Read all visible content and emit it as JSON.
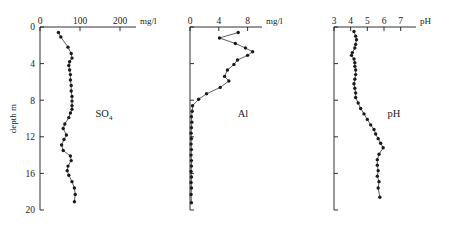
{
  "figure": {
    "depth_axis": {
      "title": "depth m",
      "ticks": [
        "0",
        "4",
        "8",
        "12",
        "16",
        "20"
      ],
      "tick_values": [
        0,
        4,
        8,
        12,
        16,
        20
      ],
      "range": [
        0,
        20
      ]
    },
    "panels": [
      {
        "name": "so4",
        "label": "SO",
        "label_sub": "4",
        "unit": "mg/l",
        "ticks": [
          "0",
          "100",
          "200"
        ],
        "tick_values": [
          0,
          100,
          200
        ],
        "range": [
          0,
          240
        ]
      },
      {
        "name": "al",
        "label": "Al",
        "label_sub": "",
        "unit": "mg/l",
        "ticks": [
          "0",
          "4",
          "8"
        ],
        "tick_values": [
          0,
          4,
          8
        ],
        "range": [
          0,
          10
        ]
      },
      {
        "name": "ph",
        "label": "pH",
        "label_sub": "",
        "unit": "pH",
        "ticks": [
          "3",
          "4",
          "5",
          "6",
          "7"
        ],
        "tick_values": [
          3,
          4,
          5,
          6,
          7
        ],
        "range": [
          3,
          7.8
        ]
      }
    ]
  },
  "chart_data": [
    {
      "type": "line",
      "title": "SO4",
      "xlabel": "mg/l",
      "ylabel": "depth m",
      "xlim": [
        0,
        240
      ],
      "ylim": [
        0,
        20
      ],
      "y_inverted": true,
      "grid": false,
      "legend": "none",
      "xticks": [
        0,
        100,
        200
      ],
      "yticks": [
        0,
        4,
        8,
        12,
        16,
        20
      ],
      "x": [
        46,
        52,
        70,
        78,
        80,
        74,
        72,
        74,
        76,
        76,
        78,
        78,
        80,
        80,
        80,
        80,
        76,
        72,
        62,
        58,
        66,
        60,
        54,
        58,
        76,
        78,
        70,
        68,
        72,
        80,
        86,
        88,
        86
      ],
      "y": [
        0.6,
        1.1,
        2.2,
        2.9,
        3.4,
        3.8,
        4.2,
        4.7,
        5.2,
        5.8,
        6.4,
        7.0,
        7.6,
        8.1,
        8.6,
        9.0,
        9.4,
        9.9,
        10.6,
        11.1,
        11.8,
        12.3,
        12.9,
        13.5,
        14.1,
        14.6,
        15.2,
        15.7,
        16.2,
        16.9,
        17.6,
        18.3,
        19.1
      ]
    },
    {
      "type": "line",
      "title": "Al",
      "xlabel": "mg/l",
      "ylabel": "depth m",
      "xlim": [
        0,
        10
      ],
      "ylim": [
        0,
        20
      ],
      "y_inverted": true,
      "grid": false,
      "legend": "none",
      "xticks": [
        0,
        4,
        8
      ],
      "yticks": [
        0,
        4,
        8,
        12,
        16,
        20
      ],
      "x": [
        6.7,
        4.1,
        6.3,
        7.7,
        8.7,
        8.0,
        6.6,
        6.1,
        5.2,
        4.8,
        5.4,
        4.2,
        2.3,
        1.2,
        0.35,
        0.3,
        0.2,
        0.25,
        0.2,
        0.15,
        0.2,
        0.15,
        0.2,
        0.15,
        0.2,
        0.2,
        0.15,
        0.2,
        0.15,
        0.2,
        0.15,
        0.2
      ],
      "y": [
        0.6,
        1.2,
        1.8,
        2.3,
        2.7,
        3.1,
        3.6,
        4.1,
        4.7,
        5.4,
        5.9,
        6.6,
        7.3,
        7.9,
        8.6,
        9.2,
        9.8,
        10.4,
        11.0,
        11.6,
        12.2,
        12.8,
        13.4,
        14.0,
        14.6,
        15.2,
        15.8,
        16.4,
        17.0,
        17.6,
        18.3,
        19.2
      ]
    },
    {
      "type": "line",
      "title": "pH",
      "xlabel": "pH",
      "ylabel": "depth m",
      "xlim": [
        3,
        7.8
      ],
      "ylim": [
        0,
        20
      ],
      "y_inverted": true,
      "grid": false,
      "legend": "none",
      "xticks": [
        3,
        4,
        5,
        6,
        7
      ],
      "yticks": [
        0,
        4,
        8,
        12,
        16,
        20
      ],
      "x": [
        4.2,
        4.3,
        4.35,
        4.3,
        4.25,
        4.1,
        4.05,
        4.2,
        4.25,
        4.25,
        4.3,
        4.3,
        4.25,
        4.2,
        4.25,
        4.3,
        4.3,
        4.45,
        4.6,
        4.8,
        5.0,
        5.2,
        5.4,
        5.5,
        5.65,
        5.8,
        5.95,
        5.7,
        5.6,
        5.6,
        5.65,
        5.6,
        5.7,
        5.65,
        5.75
      ],
      "y": [
        0.5,
        1.0,
        1.4,
        1.9,
        2.3,
        2.8,
        3.1,
        3.5,
        3.9,
        4.3,
        4.7,
        5.2,
        5.7,
        6.2,
        6.7,
        7.2,
        7.7,
        8.3,
        8.9,
        9.5,
        10.1,
        10.7,
        11.2,
        11.7,
        12.2,
        12.7,
        13.2,
        13.9,
        14.5,
        15.1,
        15.7,
        16.3,
        16.9,
        17.6,
        18.6
      ]
    }
  ]
}
